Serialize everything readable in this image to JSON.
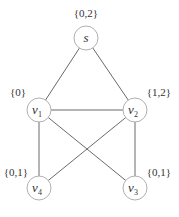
{
  "graph": {
    "nodes": [
      {
        "id": "s",
        "name": "s",
        "sub": "",
        "set": "{0,2}",
        "x": 86,
        "y": 38,
        "set_x": 86,
        "set_y": 17,
        "anchor": "middle"
      },
      {
        "id": "v1",
        "name": "v",
        "sub": "1",
        "set": "{0}",
        "x": 39,
        "y": 110,
        "set_x": 18,
        "set_y": 96,
        "anchor": "middle"
      },
      {
        "id": "v2",
        "name": "v",
        "sub": "2",
        "set": "{1,2}",
        "x": 135,
        "y": 110,
        "set_x": 159,
        "set_y": 96,
        "anchor": "middle"
      },
      {
        "id": "v4",
        "name": "v",
        "sub": "4",
        "set": "{0,1}",
        "x": 39,
        "y": 188,
        "set_x": 16,
        "set_y": 176,
        "anchor": "middle"
      },
      {
        "id": "v3",
        "name": "v",
        "sub": "3",
        "set": "{0,1}",
        "x": 135,
        "y": 188,
        "set_x": 159,
        "set_y": 176,
        "anchor": "middle"
      }
    ],
    "edges": [
      [
        "s",
        "v1"
      ],
      [
        "s",
        "v2"
      ],
      [
        "v1",
        "v2"
      ],
      [
        "v1",
        "v4"
      ],
      [
        "v1",
        "v3"
      ],
      [
        "v2",
        "v4"
      ],
      [
        "v2",
        "v3"
      ]
    ],
    "node_radius": 12
  }
}
